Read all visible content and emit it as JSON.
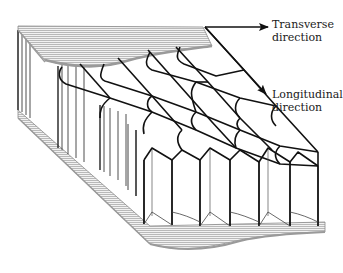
{
  "diagram": {
    "labels": {
      "transverse": [
        "Transverse",
        "direction"
      ],
      "longitudinal": [
        "Longitudinal",
        "direction"
      ]
    },
    "arrows": [
      {
        "name": "transverse-direction-arrow",
        "from": [
          205,
          27
        ],
        "to": [
          268,
          27
        ]
      },
      {
        "name": "longitudinal-direction-arrow",
        "from": [
          205,
          27
        ],
        "to": [
          266,
          94
        ]
      }
    ],
    "components": [
      "top face sheet",
      "honeycomb core",
      "bottom face sheet"
    ],
    "colors": {
      "line": "#111111",
      "sheet_hatch": "#9a9a9a",
      "sheet_fill": "#e6e6e6",
      "background": "#ffffff"
    }
  }
}
